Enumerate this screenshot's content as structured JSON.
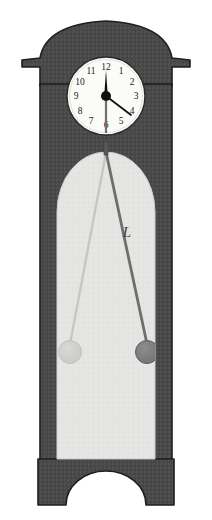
{
  "figure": {
    "background_color": "#ffffff"
  },
  "case": {
    "body_color": "#4a4a4a",
    "body_shade_color": "#565656",
    "outline_color": "#1f1f1f",
    "bonnet_name": "arched bonnet hood",
    "base_name": "plinth base with arched cutout"
  },
  "clock_face": {
    "dial_color": "#fbfbf8",
    "rim_color": "#2a2a2a",
    "hand_color": "#111111",
    "time_reading": "12:20",
    "numerals": [
      "12",
      "1",
      "2",
      "3",
      "4",
      "5",
      "6",
      "7",
      "8",
      "9",
      "10",
      "11"
    ]
  },
  "window": {
    "glass_color": "#e4e4e2",
    "glass_edge_color": "#d2d2d0",
    "name": "glazed pendulum window"
  },
  "pendulum": {
    "length_label": "L",
    "rod_color": "#6e6e6e",
    "bob_color": "#7d7d7d",
    "bob_outline_color": "#5e5e5e",
    "ghost_rod_color": "#c4c4c2",
    "ghost_bob_color": "#cfcfcd",
    "ghost_bob_outline_color": "#c0c0be",
    "pivot_color": "#5a5a5a",
    "positions": {
      "swing_right_label": "current pendulum position",
      "swing_left_label": "previous pendulum position"
    }
  },
  "colors": {
    "dark_case": "#4a4a4a",
    "light_glass": "#e4e4e2",
    "dial_white": "#fbfbf8",
    "ink_black": "#111111"
  }
}
